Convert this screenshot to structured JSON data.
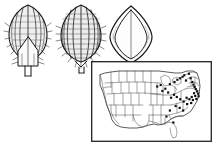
{
  "plate": {
    "kind": "botanical-illustration-plate",
    "caption": "",
    "background_color": "#ffffff",
    "ink_color": "#1a1a1a",
    "figure_count": 4
  },
  "figures": [
    {
      "id": "fig-1",
      "name": "spikelet-ventral-view",
      "description": "Ovate grass spikelet, ventral view, with longitudinal nerves, marginal hairs and a V-shaped palea, borne on a short pedicel",
      "surface": "nerved-and-pubescent",
      "has_pedicel": true,
      "label": ""
    },
    {
      "id": "fig-2",
      "name": "spikelet-dorsal-view",
      "description": "Ovate grass spikelet, dorsal view, strongly ribbed with transverse cross-bars and bristly margins, borne on a short pedicel",
      "surface": "ribbed-and-bristly",
      "has_pedicel": true,
      "label": ""
    },
    {
      "id": "fig-3",
      "name": "caryopsis-smooth-view",
      "description": "Smooth lens-shaped floret with an inner concentric outline and pointed apex and base",
      "surface": "smooth",
      "has_pedicel": false,
      "label": ""
    },
    {
      "id": "fig-map",
      "name": "us-distribution-map",
      "description": "Outline map of the conterminous United States with state boundaries and filled dots marking collection localities",
      "label": "",
      "frame": true
    }
  ],
  "chart_data": {
    "type": "scatter",
    "title": "",
    "xlabel": "",
    "ylabel": "",
    "projection": "conterminous-united-states-outline",
    "grid": false,
    "legend": "none",
    "symbol": "filled-square-dot",
    "symbol_color": "#111111",
    "xlim": [
      0,
      100
    ],
    "ylim": [
      0,
      100
    ],
    "region_summary": "Occurrence dots concentrated in the northeastern and mid-Atlantic states with scattered records in the Great Lakes, Ohio Valley, Appalachians and a few on the Gulf coast; no records in the western states.",
    "points": [
      {
        "x": 66.0,
        "y": 27.0
      },
      {
        "x": 70.0,
        "y": 24.0
      },
      {
        "x": 72.5,
        "y": 21.0
      },
      {
        "x": 75.0,
        "y": 19.0
      },
      {
        "x": 77.0,
        "y": 17.0
      },
      {
        "x": 78.5,
        "y": 15.0
      },
      {
        "x": 80.0,
        "y": 22.0
      },
      {
        "x": 82.5,
        "y": 13.0
      },
      {
        "x": 84.0,
        "y": 19.0
      },
      {
        "x": 85.5,
        "y": 24.0
      },
      {
        "x": 86.5,
        "y": 27.5
      },
      {
        "x": 87.5,
        "y": 30.5
      },
      {
        "x": 88.5,
        "y": 33.5
      },
      {
        "x": 89.5,
        "y": 36.5
      },
      {
        "x": 87.0,
        "y": 39.0
      },
      {
        "x": 90.5,
        "y": 39.5
      },
      {
        "x": 88.0,
        "y": 42.5
      },
      {
        "x": 91.0,
        "y": 43.0
      },
      {
        "x": 85.0,
        "y": 44.0
      },
      {
        "x": 89.0,
        "y": 46.5
      },
      {
        "x": 86.0,
        "y": 48.0
      },
      {
        "x": 83.0,
        "y": 47.0
      },
      {
        "x": 80.5,
        "y": 45.0
      },
      {
        "x": 84.5,
        "y": 52.0
      },
      {
        "x": 81.0,
        "y": 53.5
      },
      {
        "x": 78.0,
        "y": 50.0
      },
      {
        "x": 75.0,
        "y": 47.0
      },
      {
        "x": 72.0,
        "y": 44.0
      },
      {
        "x": 69.5,
        "y": 41.0
      },
      {
        "x": 67.0,
        "y": 45.0
      },
      {
        "x": 64.5,
        "y": 38.0
      },
      {
        "x": 62.0,
        "y": 33.0
      },
      {
        "x": 59.5,
        "y": 36.0
      },
      {
        "x": 71.0,
        "y": 56.0
      },
      {
        "x": 74.5,
        "y": 58.5
      },
      {
        "x": 77.5,
        "y": 62.0
      },
      {
        "x": 66.0,
        "y": 62.0
      },
      {
        "x": 63.0,
        "y": 70.0
      },
      {
        "x": 69.0,
        "y": 78.0
      },
      {
        "x": 58.0,
        "y": 28.0
      },
      {
        "x": 55.0,
        "y": 30.0
      }
    ],
    "state_outlines_shown": true,
    "n_points": 41
  },
  "map": {
    "title": "",
    "frame_color": "#222222",
    "line_color": "#5a5a5a",
    "dot_color": "#111111"
  }
}
